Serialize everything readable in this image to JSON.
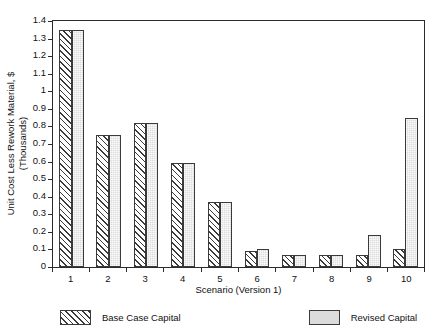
{
  "chart_data": {
    "type": "bar",
    "title": "",
    "xlabel": "Scenario (Version 1)",
    "ylabel_line1": "Unit Cost Less Rework Material, $",
    "ylabel_line2": "(Thousands)",
    "categories": [
      "1",
      "2",
      "3",
      "4",
      "5",
      "6",
      "7",
      "8",
      "9",
      "10"
    ],
    "series": [
      {
        "name": "Base Case Capital",
        "values": [
          1.35,
          0.75,
          0.82,
          0.59,
          0.37,
          0.09,
          0.07,
          0.07,
          0.07,
          0.1
        ]
      },
      {
        "name": "Revised Capital",
        "values": [
          1.35,
          0.75,
          0.82,
          0.59,
          0.37,
          0.1,
          0.07,
          0.07,
          0.18,
          0.85
        ]
      }
    ],
    "ylim": [
      0,
      1.4
    ],
    "ytick_labels": [
      "1.4",
      "1.3",
      "1.2",
      "1.1",
      "1",
      "0.9",
      "0.8",
      "0.7",
      "0.6",
      "0.5",
      "0.4",
      "0.3",
      "0.2",
      "0.1",
      "0"
    ],
    "ytick_values": [
      1.4,
      1.3,
      1.2,
      1.1,
      1.0,
      0.9,
      0.8,
      0.7,
      0.6,
      0.5,
      0.4,
      0.3,
      0.2,
      0.1,
      0
    ],
    "grid": false,
    "legend_position": "bottom",
    "colors": {
      "base_fill": "#e9e9e9",
      "revised_fill": "#dcdcdc",
      "outline": "#3a3a3a",
      "axis": "#2b2b2b"
    }
  }
}
